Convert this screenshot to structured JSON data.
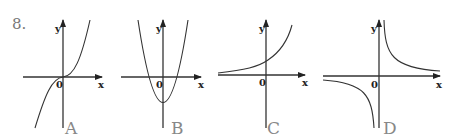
{
  "question": {
    "number": "8."
  },
  "panels": [
    {
      "id": "A",
      "label": "A",
      "x_label": "x",
      "y_label": "y",
      "origin_label": "0",
      "curve": "cubic (y = x^3)"
    },
    {
      "id": "B",
      "label": "B",
      "x_label": "x",
      "y_label": "y",
      "origin_label": "0",
      "curve": "parabola opening up, vertex below origin (y = x^2 - c)"
    },
    {
      "id": "C",
      "label": "C",
      "x_label": "x",
      "y_label": "y",
      "origin_label": "0",
      "curve": "exponential growth (y = a^x)"
    },
    {
      "id": "D",
      "label": "D",
      "x_label": "x",
      "y_label": "y",
      "origin_label": "0",
      "curve": "hyperbola (y = k/x)"
    }
  ]
}
